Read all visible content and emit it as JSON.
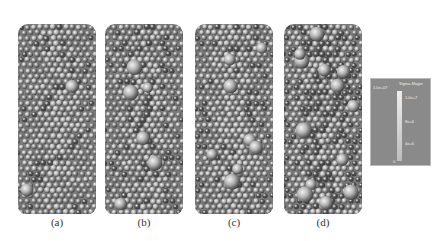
{
  "figure": {
    "panels": [
      {
        "label": "(a)",
        "style": "uniform",
        "large_ratio": 0.03,
        "dark_ratio": 0.08
      },
      {
        "label": "(b)",
        "style": "mixed",
        "large_ratio": 0.1,
        "dark_ratio": 0.15
      },
      {
        "label": "(c)",
        "style": "mixed",
        "large_ratio": 0.14,
        "dark_ratio": 0.15
      },
      {
        "label": "(d)",
        "style": "heterogeneous",
        "large_ratio": 0.22,
        "dark_ratio": 0.35
      }
    ],
    "legend": {
      "corner_value": "1.0e+07",
      "title": "Sigma-Magni",
      "ticks": [
        "1.0e+7",
        "8e+6",
        "4e+6",
        "0"
      ]
    },
    "colors": {
      "sphere_light": "#b5b5b5",
      "sphere_mid": "#8e8e8e",
      "sphere_dark": "#4e4e4e",
      "legend_bg": "#8a8a8a"
    }
  }
}
